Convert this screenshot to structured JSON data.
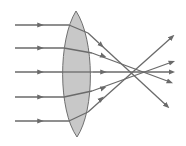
{
  "diagram": {
    "colors": {
      "background": "#ffffff",
      "lens_fill": "#c8c8c8",
      "lens_stroke": "#6f6f6f",
      "ray": "#6a6a6a"
    },
    "lens": {
      "path": "M76,11 C58,40 58,110 77,137 C95,110 95,40 76,11 Z"
    },
    "rays": [
      {
        "name": "ray-1",
        "incoming": [
          [
            15,
            25
          ],
          [
            69,
            25
          ]
        ],
        "inside": [
          [
            69,
            25
          ],
          [
            88,
            33
          ]
        ],
        "outgoing": [
          [
            88,
            33
          ],
          [
            167,
            106
          ]
        ],
        "arrow_in": [
          40,
          25
        ],
        "arrow_mid": [
          101,
          45
        ]
      },
      {
        "name": "ray-2",
        "incoming": [
          [
            15,
            48
          ],
          [
            64,
            48
          ]
        ],
        "inside": [
          [
            64,
            48
          ],
          [
            92,
            53
          ]
        ],
        "outgoing": [
          [
            92,
            53
          ],
          [
            170,
            82
          ]
        ],
        "arrow_in": [
          40,
          48
        ],
        "arrow_mid": [
          103,
          56
        ]
      },
      {
        "name": "ray-3",
        "incoming": [
          [
            15,
            72
          ],
          [
            62,
            72
          ]
        ],
        "inside": [
          [
            62,
            72
          ],
          [
            93,
            72
          ]
        ],
        "outgoing": [
          [
            93,
            72
          ],
          [
            172,
            72
          ]
        ],
        "arrow_in": [
          40,
          72
        ],
        "arrow_mid": [
          103,
          72
        ]
      },
      {
        "name": "ray-4",
        "incoming": [
          [
            15,
            97
          ],
          [
            64,
            97
          ]
        ],
        "inside": [
          [
            64,
            97
          ],
          [
            92,
            91
          ]
        ],
        "outgoing": [
          [
            92,
            91
          ],
          [
            172,
            62
          ]
        ],
        "arrow_in": [
          40,
          97
        ],
        "arrow_mid": [
          103,
          88
        ]
      },
      {
        "name": "ray-5",
        "incoming": [
          [
            15,
            121
          ],
          [
            69,
            121
          ]
        ],
        "inside": [
          [
            69,
            121
          ],
          [
            88,
            112
          ]
        ],
        "outgoing": [
          [
            88,
            112
          ],
          [
            172,
            37
          ]
        ],
        "arrow_in": [
          40,
          121
        ],
        "arrow_mid": [
          101,
          99
        ]
      }
    ],
    "focal_point": [
      134,
      71
    ]
  }
}
